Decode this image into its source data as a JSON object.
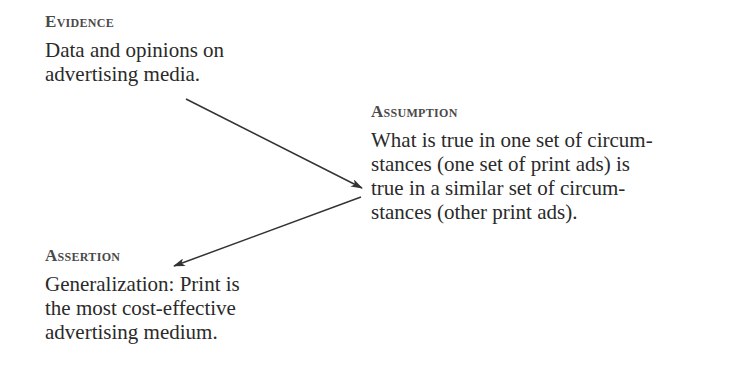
{
  "evidence": {
    "heading": "Evidence",
    "lines": [
      "Data and opinions on",
      "advertising media."
    ]
  },
  "assumption": {
    "heading": "Assumption",
    "lines": [
      "What is true in one set of circum-",
      "stances (one set of print ads) is",
      "true in a similar set of circum-",
      "stances (other print ads)."
    ]
  },
  "assertion": {
    "heading": "Assertion",
    "lines": [
      "Generalization: Print is",
      "the most cost-effective",
      "advertising medium."
    ]
  },
  "arrows": [
    {
      "from": "evidence",
      "to": "assumption"
    },
    {
      "from": "assumption",
      "to": "assertion"
    }
  ],
  "colors": {
    "text": "#2a2a2a",
    "heading": "#4a4a4a",
    "arrow": "#333333"
  }
}
